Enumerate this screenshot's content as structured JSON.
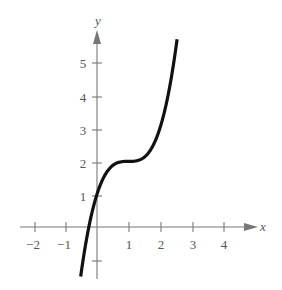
{
  "chart_data": {
    "type": "line",
    "title": "",
    "xlabel": "x",
    "ylabel": "y",
    "function": "y = (x - 1)^3 + 2",
    "xlim": [
      -2.5,
      5
    ],
    "ylim": [
      -1.5,
      6
    ],
    "grid": false,
    "legend": null,
    "x_ticks": [
      -2,
      -1,
      1,
      2,
      3,
      4
    ],
    "x_tick_labels": [
      "−2",
      "−1",
      "1",
      "2",
      "3",
      "4"
    ],
    "y_ticks": [
      -1,
      1,
      2,
      3,
      4,
      5
    ],
    "y_tick_labels": [
      "",
      "1",
      "2",
      "3",
      "4",
      "5"
    ],
    "series": [
      {
        "name": "f(x)",
        "x": [
          -0.52,
          -0.25,
          0,
          0.25,
          0.5,
          0.75,
          1,
          1.25,
          1.5,
          1.75,
          2,
          2.25,
          2.55
        ],
        "y": [
          -1.51,
          -0.95,
          1.0,
          1.58,
          1.88,
          1.98,
          2.0,
          2.02,
          2.13,
          2.42,
          3.0,
          3.95,
          5.72
        ]
      }
    ],
    "annotations": [
      "Horizontal inflection point at (1, 2)",
      "y-intercept at (0, 1)"
    ]
  },
  "labels": {
    "x_axis": "x",
    "y_axis": "y",
    "x_ticks": [
      "−2",
      "−1",
      "1",
      "2",
      "3",
      "4"
    ],
    "y_ticks": [
      "1",
      "2",
      "3",
      "4",
      "5"
    ]
  },
  "colors": {
    "curve": "#111111",
    "axis": "#777777",
    "text": "#555555",
    "background": "#ffffff"
  }
}
